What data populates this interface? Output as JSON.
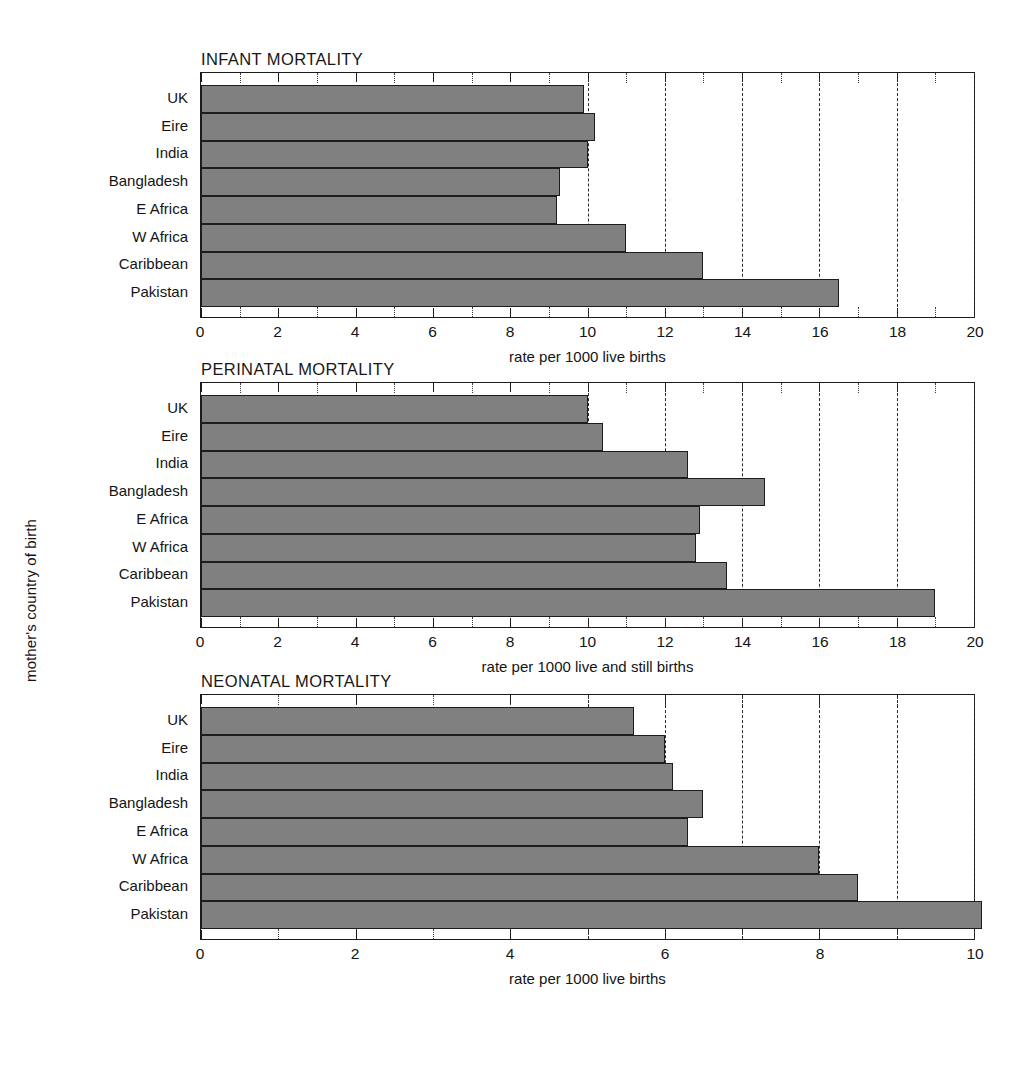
{
  "figure": {
    "ylabel": "mother's country of birth",
    "categories": [
      "UK",
      "Eire",
      "India",
      "Bangladesh",
      "E Africa",
      "W Africa",
      "Caribbean",
      "Pakistan"
    ],
    "bar_color": "#808080",
    "bar_edge_color": "#1d1d1d",
    "axis_color": "#1b1b1b",
    "grid_color": "#2a2a2a"
  },
  "chart_data": [
    {
      "type": "bar",
      "orientation": "horizontal",
      "title": "INFANT MORTALITY",
      "xlabel": "rate per 1000 live births",
      "ylabel": "mother's country of birth",
      "categories": [
        "UK",
        "Eire",
        "India",
        "Bangladesh",
        "E Africa",
        "W Africa",
        "Caribbean",
        "Pakistan"
      ],
      "values": [
        9.9,
        10.2,
        10.0,
        9.3,
        9.2,
        11.0,
        13.0,
        16.5
      ],
      "xlim": [
        0,
        20
      ],
      "xticks": [
        0,
        2,
        4,
        6,
        8,
        10,
        12,
        14,
        16,
        18,
        20
      ],
      "xtick_labels": [
        "0",
        "2",
        "4",
        "6",
        "8",
        "10",
        "12",
        "14",
        "16",
        "18",
        "20"
      ],
      "gridlines_at": [
        10,
        12,
        14,
        16,
        18,
        20
      ],
      "minor_ticks_at": [
        1,
        3,
        5,
        7,
        9,
        11,
        13,
        15,
        17,
        19
      ],
      "grid": true,
      "legend": "none"
    },
    {
      "type": "bar",
      "orientation": "horizontal",
      "title": "PERINATAL MORTALITY",
      "xlabel": "rate per 1000 live and still births",
      "ylabel": "mother's country of birth",
      "categories": [
        "UK",
        "Eire",
        "India",
        "Bangladesh",
        "E Africa",
        "W Africa",
        "Caribbean",
        "Pakistan"
      ],
      "values": [
        10.0,
        10.4,
        12.6,
        14.6,
        12.9,
        12.8,
        13.6,
        19.0
      ],
      "xlim": [
        0,
        20
      ],
      "xticks": [
        0,
        2,
        4,
        6,
        8,
        10,
        12,
        14,
        16,
        18,
        20
      ],
      "xtick_labels": [
        "0",
        "2",
        "4",
        "6",
        "8",
        "10",
        "12",
        "14",
        "16",
        "18",
        "20"
      ],
      "gridlines_at": [
        10,
        12,
        14,
        16,
        18,
        20
      ],
      "minor_ticks_at": [
        1,
        3,
        5,
        7,
        9,
        11,
        13,
        15,
        17,
        19
      ],
      "grid": true,
      "legend": "none"
    },
    {
      "type": "bar",
      "orientation": "horizontal",
      "title": "NEONATAL MORTALITY",
      "xlabel": "rate per 1000 live births",
      "ylabel": "mother's country of birth",
      "categories": [
        "UK",
        "Eire",
        "India",
        "Bangladesh",
        "E Africa",
        "W Africa",
        "Caribbean",
        "Pakistan"
      ],
      "values": [
        5.6,
        6.0,
        6.1,
        6.5,
        6.3,
        8.0,
        8.5,
        10.1
      ],
      "xlim": [
        0,
        10
      ],
      "xticks": [
        0,
        2,
        4,
        6,
        8,
        10
      ],
      "xtick_labels": [
        "0",
        "2",
        "4",
        "6",
        "8",
        "10"
      ],
      "gridlines_at": [
        5,
        6,
        7,
        8,
        9,
        10
      ],
      "minor_ticks_at": [
        1,
        2,
        3,
        4,
        5,
        6,
        7,
        8,
        9
      ],
      "grid": true,
      "legend": "none"
    }
  ]
}
